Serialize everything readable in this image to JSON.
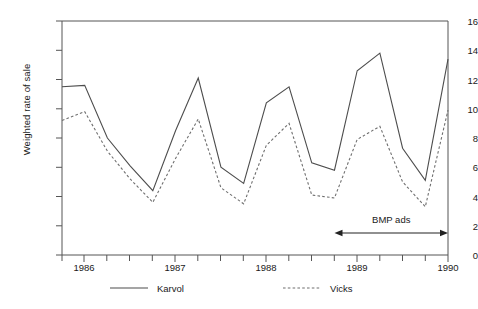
{
  "chart_data": {
    "type": "line",
    "title": "",
    "xlabel": "",
    "ylabel": "Weighted rate of sale",
    "xlim": [
      1985.75,
      1990.0
    ],
    "ylim": [
      0,
      16
    ],
    "grid": false,
    "legend_position": "below-axes",
    "y_ticks": [
      0,
      2,
      4,
      6,
      8,
      10,
      12,
      14,
      16
    ],
    "y_tick_labels": [
      "0",
      "2",
      "4",
      "6",
      "8",
      "10",
      "12",
      "14",
      "16"
    ],
    "x_ticks": [
      1986,
      1987,
      1988,
      1989,
      1990
    ],
    "x_tick_labels": [
      "1986",
      "1987",
      "1988",
      "1989",
      "1990"
    ],
    "x_minor_tick_interval": 0.25,
    "x": [
      1985.75,
      1986.0,
      1986.25,
      1986.5,
      1986.75,
      1987.0,
      1987.25,
      1987.5,
      1987.75,
      1988.0,
      1988.25,
      1988.5,
      1988.75,
      1989.0,
      1989.25,
      1989.5,
      1989.75,
      1990.0
    ],
    "series": [
      {
        "name": "Karvol",
        "style": "solid",
        "color": "#4d4d4d",
        "values": [
          11.5,
          11.6,
          8.0,
          6.1,
          4.4,
          8.5,
          12.1,
          6.0,
          4.9,
          10.4,
          11.5,
          6.3,
          5.8,
          12.6,
          13.8,
          7.3,
          5.1,
          13.4
        ]
      },
      {
        "name": "Vicks",
        "style": "dashed",
        "color": "#6e6e6e",
        "values": [
          9.2,
          9.8,
          7.1,
          5.2,
          3.6,
          6.6,
          9.3,
          4.6,
          3.5,
          7.5,
          9.0,
          4.1,
          3.9,
          7.9,
          8.8,
          5.0,
          3.3,
          9.9
        ]
      }
    ],
    "annotations": [
      {
        "name": "bmp-ads",
        "text": "BMP ads",
        "type": "double-arrow",
        "x_start": 1988.75,
        "x_end": 1990.0,
        "y": 1.5,
        "label_y": 2.4
      }
    ]
  },
  "legend": {
    "items": [
      {
        "label": "Karvol",
        "style": "solid"
      },
      {
        "label": "Vicks",
        "style": "dashed"
      }
    ]
  }
}
